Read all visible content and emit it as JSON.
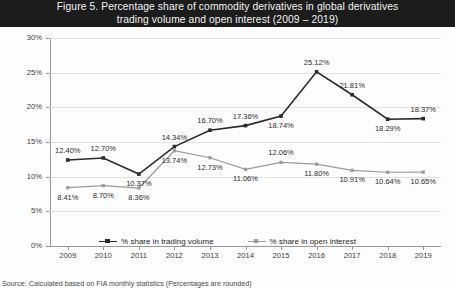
{
  "figure": {
    "title": "Figure 5.  Percentage share of commodity derivatives in global derivatives trading volume and open interest (2009 – 2019)",
    "title_line1": "Figure 5.  Percentage share of commodity derivatives in global derivatives",
    "title_line2": "trading volume and open interest (2009 – 2019)",
    "source_note": "Source: Calculated based on FIA monthly statistics (Percentages are rounded)"
  },
  "colors": {
    "title_band": "#1c1c1c",
    "title_text": "#f2f2f2",
    "series_volume": "#2b2b2b",
    "series_open_interest": "#9b9b9b",
    "gridline": "#e2e2e2",
    "axis": "#9a9a9a",
    "plot_background": "#fdfdfd"
  },
  "legend": {
    "position": "bottom-center",
    "items": [
      {
        "label": "% share in trading volume",
        "marker": "square-line",
        "color": "#2b2b2b"
      },
      {
        "label": "% share in open interest",
        "marker": "square-line",
        "color": "#9b9b9b"
      }
    ]
  },
  "axes": {
    "y_ticks": [
      "0%",
      "5%",
      "10%",
      "15%",
      "20%",
      "25%",
      "30%"
    ],
    "x_ticks": [
      "2009",
      "2010",
      "2011",
      "2012",
      "2013",
      "2014",
      "2015",
      "2016",
      "2017",
      "2018",
      "2019"
    ]
  },
  "chart_data": {
    "type": "line",
    "title": "Figure 5.  Percentage share of commodity derivatives in global derivatives trading volume and open interest (2009 – 2019)",
    "xlabel": "",
    "ylabel": "",
    "ylim": [
      0,
      30
    ],
    "ytick_values": [
      0,
      5,
      10,
      15,
      20,
      25,
      30
    ],
    "ytick_labels": [
      "0%",
      "5%",
      "10%",
      "15%",
      "20%",
      "25%",
      "30%"
    ],
    "grid": true,
    "legend_position": "bottom",
    "categories": [
      "2009",
      "2010",
      "2011",
      "2012",
      "2013",
      "2014",
      "2015",
      "2016",
      "2017",
      "2018",
      "2019"
    ],
    "series": [
      {
        "name": "% share in trading volume",
        "color": "#2b2b2b",
        "marker": "square",
        "values": [
          12.4,
          12.7,
          10.37,
          14.34,
          16.7,
          17.36,
          18.74,
          25.12,
          21.81,
          18.29,
          18.37
        ],
        "data_labels": [
          "12.40%",
          "12.70%",
          "10.37%",
          "14.34%",
          "16.70%",
          "17.36%",
          "18.74%",
          "25.12%",
          "21.81%",
          "18.29%",
          "18.37%"
        ]
      },
      {
        "name": "% share in open interest",
        "color": "#9b9b9b",
        "marker": "square",
        "values": [
          8.41,
          8.7,
          8.36,
          13.74,
          12.73,
          11.06,
          12.06,
          11.8,
          10.91,
          10.64,
          10.65
        ],
        "data_labels": [
          "8.41%",
          "8.70%",
          "8.36%",
          "13.74%",
          "12.73%",
          "11.06%",
          "12.06%",
          "11.80%",
          "10.91%",
          "10.64%",
          "10.65%"
        ]
      }
    ]
  },
  "label_placement": {
    "volume": [
      "above",
      "above",
      "below",
      "above",
      "above",
      "above",
      "below",
      "above",
      "above",
      "below",
      "above"
    ],
    "open_interest": [
      "below",
      "below",
      "below",
      "below",
      "below",
      "below",
      "above",
      "below",
      "below",
      "below",
      "below"
    ]
  }
}
